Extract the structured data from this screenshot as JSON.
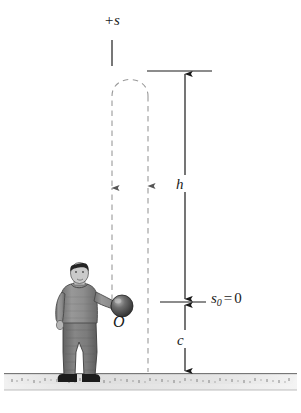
{
  "figure": {
    "background_color": "#ffffff",
    "width": 301,
    "height": 413
  },
  "labels": {
    "axis_positive": "+s",
    "height_h": "h",
    "height_c": "c",
    "origin": "O",
    "s0_symbol": "s",
    "s0_subscript": "0",
    "s0_equals": "=",
    "s0_value": "0"
  },
  "colors": {
    "line": "#1a1a1a",
    "dashed_line": "#8c8c8c",
    "ground_top": "#e8e8e8",
    "ground_face": "#d0d0d0",
    "ground_edge": "#5a5a5a",
    "sweater": "#8e8e8e",
    "sweater_shadow": "#6e6e6e",
    "pants": "#7a7a7a",
    "pants_shadow": "#5e5e5e",
    "hair": "#2a2a2a",
    "skin": "#cfcfcf",
    "shoes": "#1f1f1f",
    "ball": "#4a4a4a",
    "ball_highlight": "#a8a8a8"
  },
  "elements": {
    "axis_tick_name": "positive-s-axis-marker",
    "trajectory_up_name": "trajectory-upward-path",
    "trajectory_down_name": "trajectory-downward-path",
    "dimension_h_name": "dimension-line-h",
    "dimension_c_name": "dimension-line-c",
    "ground_name": "ground-surface",
    "person_name": "person-figure",
    "ball_name": "ball"
  }
}
